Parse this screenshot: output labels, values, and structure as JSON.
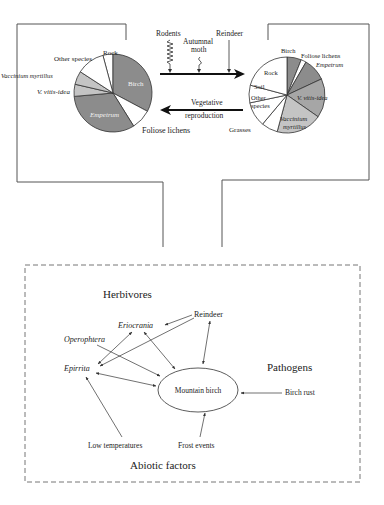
{
  "colors": {
    "dark": "#8c8c8c",
    "mid": "#a6a6a6",
    "light": "#c4c4c4",
    "white": "#ffffff",
    "line": "#444444",
    "text": "#222222"
  },
  "top_panel": {
    "arrow_forward_agents": [
      "Rodents",
      "Autumnal",
      "moth",
      "Reindeer"
    ],
    "arrow_back_label_1": "Vegetative",
    "arrow_back_label_2": "reproduction",
    "left_pie": {
      "slices": [
        {
          "name": "Rock",
          "italic": false,
          "fill": "white",
          "start": 345,
          "end": 360
        },
        {
          "name": "Birch",
          "italic": false,
          "fill": "dark",
          "start": 0,
          "end": 118,
          "inside": true
        },
        {
          "name": "Foliose lichens",
          "italic": false,
          "fill": "white",
          "start": 118,
          "end": 148
        },
        {
          "name": "Empetrum",
          "italic": true,
          "fill": "dark",
          "start": 148,
          "end": 265,
          "inside": true
        },
        {
          "name": "V. vitis-idea",
          "italic": true,
          "fill": "light",
          "start": 265,
          "end": 283
        },
        {
          "name": "Vaccinium myrtillus",
          "italic": true,
          "fill": "light",
          "start": 283,
          "end": 303
        },
        {
          "name": "Other species",
          "italic": false,
          "fill": "white",
          "start": 303,
          "end": 345
        }
      ],
      "labels": {
        "rock": "Rock",
        "birch": "Birch",
        "foliose": "Foliose lichens",
        "empetrum": "Empetrum",
        "vitis": "V. vitis-idea",
        "myrtillus": "Vaccinium myrtillus",
        "other": "Other species"
      }
    },
    "right_pie": {
      "slices": [
        {
          "name": "Birch",
          "fill": "dark",
          "start": 0,
          "end": 22
        },
        {
          "name": "Foliose lichens",
          "fill": "white",
          "start": 22,
          "end": 30
        },
        {
          "name": "Empetrum",
          "fill": "dark",
          "start": 30,
          "end": 65
        },
        {
          "name": "V. vitis-idea",
          "fill": "mid",
          "start": 65,
          "end": 125
        },
        {
          "name": "Vaccinium myrtillus",
          "fill": "light",
          "start": 125,
          "end": 195
        },
        {
          "name": "Grasses",
          "fill": "white",
          "start": 195,
          "end": 220
        },
        {
          "name": "Other species",
          "fill": "white",
          "start": 220,
          "end": 258
        },
        {
          "name": "Soil",
          "fill": "white",
          "start": 258,
          "end": 285
        },
        {
          "name": "Rock",
          "fill": "white",
          "start": 285,
          "end": 360
        }
      ],
      "labels": {
        "birch": "Birch",
        "foliose": "Foliose lichens",
        "empetrum": "Empetrum",
        "vitis": "V. vitis-idea",
        "myrtillus_1": "Vaccinium",
        "myrtillus_2": "myrtillus",
        "grasses": "Grasses",
        "other_1": "Other",
        "other_2": "species",
        "soil": "Soil",
        "rock": "Rock"
      }
    }
  },
  "bottom_panel": {
    "group_herbivores": "Herbivores",
    "group_pathogens": "Pathogens",
    "group_abiotic": "Abiotic factors",
    "center_node": "Mountain birch",
    "nodes": {
      "reindeer": "Reindeer",
      "eriocrania": "Eriocrania",
      "operophtera": "Operophtera",
      "epirrita": "Epirrita",
      "birch_rust": "Birch rust",
      "low_temp": "Low temperatures",
      "frost": "Frost events"
    }
  }
}
